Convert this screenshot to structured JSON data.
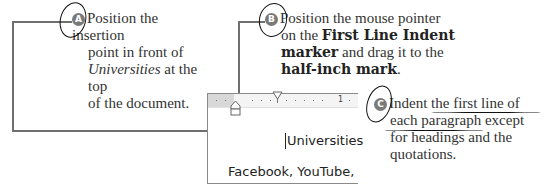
{
  "callouts": [
    {
      "id": "A",
      "badge": "A",
      "lines": [
        {
          "parts": [
            {
              "text": "Position the insertion",
              "style": "normal"
            }
          ]
        },
        {
          "parts": [
            {
              "text": "point in front of",
              "style": "normal"
            }
          ]
        },
        {
          "parts": [
            {
              "text": "Universities",
              "style": "italic"
            },
            {
              "text": " at the top",
              "style": "normal"
            }
          ]
        },
        {
          "parts": [
            {
              "text": "of the document.",
              "style": "normal"
            }
          ]
        }
      ]
    },
    {
      "id": "B",
      "badge": "B",
      "lines": [
        {
          "parts": [
            {
              "text": "Position the mouse pointer",
              "style": "normal"
            }
          ]
        },
        {
          "parts": [
            {
              "text": "on the ",
              "style": "normal"
            },
            {
              "text": "First Line Indent",
              "style": "bold"
            }
          ]
        },
        {
          "parts": [
            {
              "text": "marker",
              "style": "bold"
            },
            {
              "text": " and drag it to the",
              "style": "normal"
            }
          ]
        },
        {
          "parts": [
            {
              "text": "half-inch mark",
              "style": "bold"
            },
            {
              "text": ".",
              "style": "normal"
            }
          ]
        }
      ]
    },
    {
      "id": "C",
      "badge": "C",
      "lines": [
        {
          "parts": [
            {
              "text": "Indent the first line of",
              "style": "normal"
            }
          ]
        },
        {
          "parts": [
            {
              "text": "each paragraph except",
              "style": "normal"
            }
          ]
        },
        {
          "parts": [
            {
              "text": "for headings and the",
              "style": "normal"
            }
          ]
        },
        {
          "parts": [
            {
              "text": "quotations.",
              "style": "normal"
            }
          ]
        }
      ]
    }
  ],
  "document_preview": {
    "ruler": {
      "number_label": "1",
      "markers": [
        "first-line-indent-marker",
        "hanging-indent-marker"
      ]
    },
    "lines": [
      "Universities",
      "Facebook, YouTube,"
    ]
  },
  "colors": {
    "leader_line": "#6f6f6f",
    "badge": "#7a7a7a",
    "ruler_margin": "#d8d8d8",
    "handwriting": "#111111"
  }
}
